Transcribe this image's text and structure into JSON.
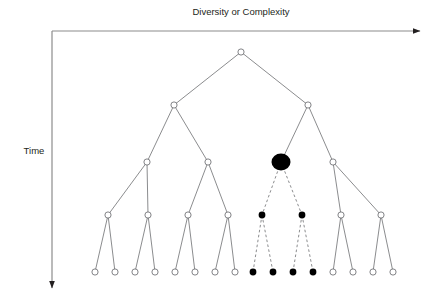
{
  "figure": {
    "type": "phylogenetic-tree-diagram",
    "axes": {
      "x_label": "Diversity or Complexity",
      "y_label": "Time",
      "x_label_pos": {
        "x": 241,
        "y": 15
      },
      "y_label_pos": {
        "x": 34,
        "y": 154
      },
      "x_axis": {
        "x1": 52,
        "y1": 31,
        "x2": 420,
        "y2": 31,
        "arrow": "right"
      },
      "y_axis": {
        "x1": 52,
        "y1": 31,
        "x2": 52,
        "y2": 288,
        "arrow": "down"
      },
      "axis_color": "#8c8c8c"
    },
    "style": {
      "open_node_stroke": "#6d6e71",
      "open_node_fill": "#ffffff",
      "filled_node_fill": "#000000",
      "branch_color": "#6d6e71",
      "dashed_branch_color": "#6d6e71",
      "node_radius": 3.1,
      "extinct_node_radius": 3.4,
      "highlight_node_rx": 9.5,
      "highlight_node_ry": 8.5
    },
    "levels": [
      {
        "name": "root",
        "y": 52
      },
      {
        "name": "level-1",
        "y": 105
      },
      {
        "name": "level-2",
        "y": 162
      },
      {
        "name": "level-3",
        "y": 215
      },
      {
        "name": "level-4",
        "y": 272
      }
    ],
    "nodes": [
      {
        "id": "n0",
        "x": 241,
        "y": 52,
        "kind": "open",
        "level": 0
      },
      {
        "id": "n1",
        "x": 174,
        "y": 105,
        "kind": "open",
        "level": 1
      },
      {
        "id": "n2",
        "x": 308,
        "y": 105,
        "kind": "open",
        "level": 1
      },
      {
        "id": "n3",
        "x": 147,
        "y": 162,
        "kind": "open",
        "level": 2
      },
      {
        "id": "n4",
        "x": 208,
        "y": 162,
        "kind": "open",
        "level": 2
      },
      {
        "id": "n5",
        "x": 281,
        "y": 162,
        "kind": "highlight",
        "level": 2
      },
      {
        "id": "n6",
        "x": 333,
        "y": 162,
        "kind": "open",
        "level": 2
      },
      {
        "id": "n7",
        "x": 108,
        "y": 215,
        "kind": "open",
        "level": 3
      },
      {
        "id": "n8",
        "x": 148,
        "y": 215,
        "kind": "open",
        "level": 3
      },
      {
        "id": "n9",
        "x": 188,
        "y": 215,
        "kind": "open",
        "level": 3
      },
      {
        "id": "n10",
        "x": 228,
        "y": 215,
        "kind": "open",
        "level": 3
      },
      {
        "id": "n11",
        "x": 262,
        "y": 215,
        "kind": "filled",
        "level": 3
      },
      {
        "id": "n12",
        "x": 302,
        "y": 215,
        "kind": "filled",
        "level": 3
      },
      {
        "id": "n13",
        "x": 341,
        "y": 215,
        "kind": "open",
        "level": 3
      },
      {
        "id": "n14",
        "x": 381,
        "y": 215,
        "kind": "open",
        "level": 3
      },
      {
        "id": "n15",
        "x": 95,
        "y": 272,
        "kind": "open",
        "level": 4
      },
      {
        "id": "n16",
        "x": 115,
        "y": 272,
        "kind": "open",
        "level": 4
      },
      {
        "id": "n17",
        "x": 135,
        "y": 272,
        "kind": "open",
        "level": 4
      },
      {
        "id": "n18",
        "x": 155,
        "y": 272,
        "kind": "open",
        "level": 4
      },
      {
        "id": "n19",
        "x": 175,
        "y": 272,
        "kind": "open",
        "level": 4
      },
      {
        "id": "n20",
        "x": 195,
        "y": 272,
        "kind": "open",
        "level": 4
      },
      {
        "id": "n21",
        "x": 215,
        "y": 272,
        "kind": "open",
        "level": 4
      },
      {
        "id": "n22",
        "x": 235,
        "y": 272,
        "kind": "open",
        "level": 4
      },
      {
        "id": "n23",
        "x": 253,
        "y": 272,
        "kind": "filled",
        "level": 4
      },
      {
        "id": "n24",
        "x": 273,
        "y": 272,
        "kind": "filled",
        "level": 4
      },
      {
        "id": "n25",
        "x": 293,
        "y": 272,
        "kind": "filled",
        "level": 4
      },
      {
        "id": "n26",
        "x": 313,
        "y": 272,
        "kind": "filled",
        "level": 4
      },
      {
        "id": "n27",
        "x": 333,
        "y": 272,
        "kind": "open",
        "level": 4
      },
      {
        "id": "n28",
        "x": 353,
        "y": 272,
        "kind": "open",
        "level": 4
      },
      {
        "id": "n29",
        "x": 373,
        "y": 272,
        "kind": "open",
        "level": 4
      },
      {
        "id": "n30",
        "x": 393,
        "y": 272,
        "kind": "open",
        "level": 4
      }
    ],
    "branches": [
      {
        "from": "n0",
        "to": "n1",
        "style": "solid"
      },
      {
        "from": "n0",
        "to": "n2",
        "style": "solid"
      },
      {
        "from": "n1",
        "to": "n3",
        "style": "solid"
      },
      {
        "from": "n1",
        "to": "n4",
        "style": "solid"
      },
      {
        "from": "n2",
        "to": "n5",
        "style": "solid"
      },
      {
        "from": "n2",
        "to": "n6",
        "style": "solid"
      },
      {
        "from": "n3",
        "to": "n7",
        "style": "solid"
      },
      {
        "from": "n3",
        "to": "n8",
        "style": "solid"
      },
      {
        "from": "n4",
        "to": "n9",
        "style": "solid"
      },
      {
        "from": "n4",
        "to": "n10",
        "style": "solid"
      },
      {
        "from": "n5",
        "to": "n11",
        "style": "dashed"
      },
      {
        "from": "n5",
        "to": "n12",
        "style": "dashed"
      },
      {
        "from": "n6",
        "to": "n13",
        "style": "solid"
      },
      {
        "from": "n6",
        "to": "n14",
        "style": "solid"
      },
      {
        "from": "n7",
        "to": "n15",
        "style": "solid"
      },
      {
        "from": "n7",
        "to": "n16",
        "style": "solid"
      },
      {
        "from": "n8",
        "to": "n17",
        "style": "solid"
      },
      {
        "from": "n8",
        "to": "n18",
        "style": "solid"
      },
      {
        "from": "n9",
        "to": "n19",
        "style": "solid"
      },
      {
        "from": "n9",
        "to": "n20",
        "style": "solid"
      },
      {
        "from": "n10",
        "to": "n21",
        "style": "solid"
      },
      {
        "from": "n10",
        "to": "n22",
        "style": "solid"
      },
      {
        "from": "n11",
        "to": "n23",
        "style": "dashed"
      },
      {
        "from": "n11",
        "to": "n24",
        "style": "dashed"
      },
      {
        "from": "n12",
        "to": "n25",
        "style": "dashed"
      },
      {
        "from": "n12",
        "to": "n26",
        "style": "dashed"
      },
      {
        "from": "n13",
        "to": "n27",
        "style": "solid"
      },
      {
        "from": "n13",
        "to": "n28",
        "style": "solid"
      },
      {
        "from": "n14",
        "to": "n29",
        "style": "solid"
      },
      {
        "from": "n14",
        "to": "n30",
        "style": "solid"
      }
    ]
  }
}
